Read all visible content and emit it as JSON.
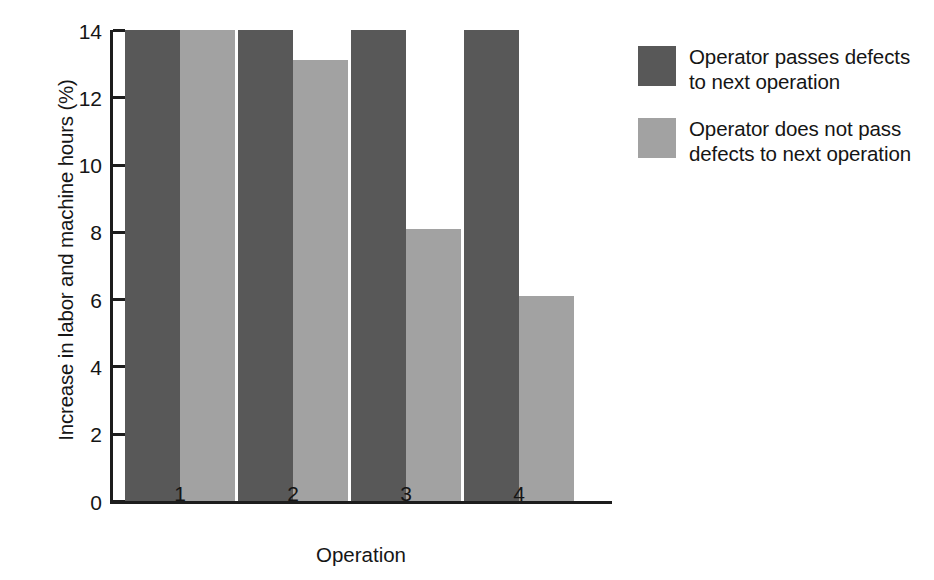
{
  "chart_data": {
    "type": "bar",
    "title": "",
    "xlabel": "Operation",
    "ylabel": "Increase in labor and machine hours (%)",
    "categories": [
      "1",
      "2",
      "3",
      "4"
    ],
    "series": [
      {
        "name": "Operator passes defects to next operation",
        "color": "#585858",
        "values": [
          14.0,
          14.0,
          14.0,
          14.0
        ]
      },
      {
        "name": "Operator does not pass defects to next operation",
        "color": "#a2a2a2",
        "values": [
          14.0,
          13.1,
          8.1,
          6.1
        ]
      }
    ],
    "ylim": [
      0,
      14
    ],
    "yticks": [
      0,
      2,
      4,
      6,
      8,
      10,
      12,
      14
    ],
    "ytick_labels": [
      "0",
      "2",
      "4",
      "6",
      "8",
      "10",
      "12",
      "14"
    ],
    "grid": false,
    "legend_position": "right"
  },
  "legend": {
    "entries": [
      {
        "swatch": "dark",
        "line1": "Operator passes defects",
        "line2": "to next operation"
      },
      {
        "swatch": "light",
        "line1": "Operator does not pass",
        "line2": "defects to next operation"
      }
    ]
  }
}
